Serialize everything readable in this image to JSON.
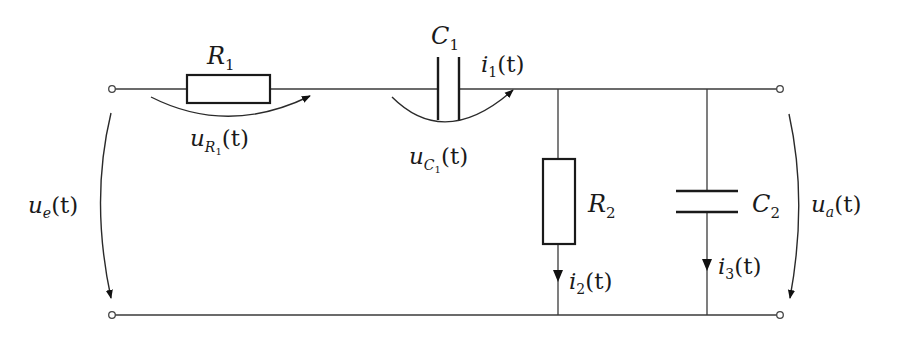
{
  "diagram": {
    "type": "circuit",
    "components": {
      "R1": {
        "name": "R",
        "sub": "1"
      },
      "C1": {
        "name": "C",
        "sub": "1"
      },
      "R2": {
        "name": "R",
        "sub": "2"
      },
      "C2": {
        "name": "C",
        "sub": "2"
      }
    },
    "voltages": {
      "ue": {
        "sym": "u",
        "sub": "e",
        "arg": "(t)"
      },
      "uR1": {
        "sym": "u",
        "sub": "R",
        "subsub": "1",
        "arg": "(t)"
      },
      "uC1": {
        "sym": "u",
        "sub": "C",
        "subsub": "1",
        "arg": "(t)"
      },
      "ua": {
        "sym": "u",
        "sub": "a",
        "arg": "(t)"
      }
    },
    "currents": {
      "i1": {
        "sym": "i",
        "sub": "1",
        "arg": "(t)"
      },
      "i2": {
        "sym": "i",
        "sub": "2",
        "arg": "(t)"
      },
      "i3": {
        "sym": "i",
        "sub": "3",
        "arg": "(t)"
      }
    },
    "colors": {
      "line": "#1a1a1a",
      "background": "#ffffff"
    }
  }
}
